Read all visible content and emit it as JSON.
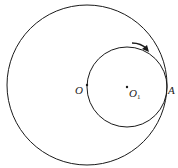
{
  "diagram": {
    "type": "geometry",
    "colors": {
      "stroke": "#1a1a1a",
      "background": "#ffffff"
    },
    "large_circle": {
      "center_label": "O",
      "cx": 87,
      "cy": 85,
      "r": 80
    },
    "small_circle": {
      "center_label": "O",
      "center_subscript": "1",
      "cx": 127,
      "cy": 87,
      "r": 40
    },
    "tangent_point": {
      "label": "A"
    },
    "arrow": {
      "direction": "clockwise"
    },
    "labels": {
      "O": "O",
      "O1_main": "O",
      "O1_sub": "1",
      "A": "A"
    }
  }
}
